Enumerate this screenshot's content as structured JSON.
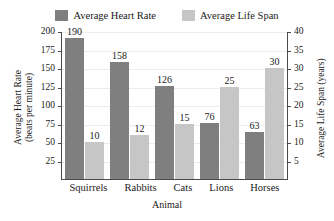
{
  "chart_data": {
    "type": "bar",
    "title": "",
    "xlabel": "Animal",
    "categories": [
      "Squirrels",
      "Rabbits",
      "Cats",
      "Lions",
      "Horses"
    ],
    "series": [
      {
        "name": "Average Heart Rate",
        "axis": "left",
        "color": "#7f7f7f",
        "values": [
          190,
          158,
          126,
          76,
          63
        ]
      },
      {
        "name": "Average Life Span",
        "axis": "right",
        "color": "#c6c6c6",
        "values": [
          10,
          12,
          15,
          25,
          30
        ]
      }
    ],
    "left_axis": {
      "label_line1": "Average Heart Rate",
      "label_line2": "(beats per minute)",
      "ylim": [
        0,
        200
      ],
      "ticks": [
        200,
        175,
        150,
        125,
        100,
        75,
        50,
        25
      ]
    },
    "right_axis": {
      "label": "Average Life Span (years)",
      "ylim": [
        0,
        40
      ],
      "ticks": [
        40,
        35,
        30,
        25,
        20,
        15,
        10,
        5
      ]
    },
    "grid": true,
    "legend_position": "top-center",
    "colors": {
      "heart_rate": "#7f7f7f",
      "life_span": "#c6c6c6",
      "axis": "#4a4a4a",
      "gridline": "#ececec",
      "background": "#ffffff"
    }
  },
  "legend": {
    "items": [
      {
        "label": "Average Heart Rate",
        "color": "#7f7f7f"
      },
      {
        "label": "Average Life Span",
        "color": "#c6c6c6"
      }
    ]
  }
}
